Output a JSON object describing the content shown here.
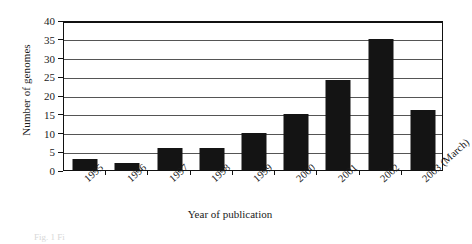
{
  "chart_data": {
    "type": "bar",
    "title": "",
    "xlabel": "Year of publication",
    "ylabel": "Number of genomes",
    "categories": [
      "1995",
      "1996",
      "1997",
      "1998",
      "1999",
      "2000",
      "2001",
      "2002",
      "2003 (March)"
    ],
    "values": [
      3,
      2,
      6,
      6,
      10,
      15,
      24,
      35,
      16
    ],
    "ylim": [
      0,
      40
    ],
    "ytick_values": [
      0,
      5,
      10,
      15,
      20,
      25,
      30,
      35,
      40
    ],
    "ytick_labels": [
      "0",
      "5",
      "10",
      "15",
      "20",
      "25",
      "30",
      "35",
      "40"
    ],
    "grid": true,
    "legend": false,
    "series": [
      {
        "name": "Number of genomes",
        "color": "#141414",
        "values": [
          3,
          2,
          6,
          6,
          10,
          15,
          24,
          35,
          16
        ]
      }
    ]
  },
  "style": {
    "bar_color": "#141414",
    "gridline_color": "#555555",
    "axis_color": "#111111",
    "background": "#ffffff"
  },
  "caption": {
    "text": "Fig. 1 Fi"
  }
}
